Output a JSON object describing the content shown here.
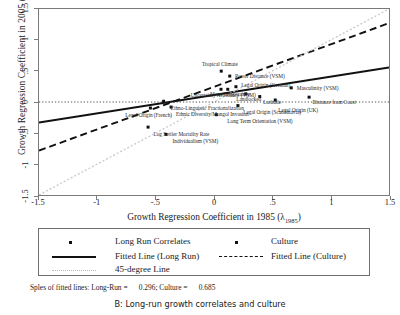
{
  "chart_data": {
    "type": "scatter",
    "title": "B: Long-run growth correlates and culture",
    "xlabel": "Growth Regression Coefficient in 1985 (λ1985)",
    "ylabel": "Growth Regression Coefficient in 2005 (λ2005)",
    "xlim": [
      -1.5,
      1.5
    ],
    "ylim": [
      -1.5,
      1.5
    ],
    "xticks": [
      "-1.5",
      "-1",
      "-.5",
      "0",
      ".5",
      "1",
      "1.5"
    ],
    "xtick_values": [
      -1.5,
      -1,
      -0.5,
      0,
      0.5,
      1,
      1.5
    ],
    "yticks": [
      "-1.5",
      "-1",
      "-.5",
      "0",
      ".5",
      "1",
      "1.5"
    ],
    "ytick_values": [
      -1.5,
      -1,
      -0.5,
      0,
      0.5,
      1,
      1.5
    ],
    "grid": false,
    "legend_position": "below-axes",
    "series": [
      {
        "name": "Long Run Correlates",
        "marker": "square",
        "points": [
          {
            "label": "Tropical Climate",
            "x": 0.062,
            "y": 0.498,
            "label_dx": -0.02,
            "label_dy": 0.105,
            "label_anchor": "middle"
          },
          {
            "label": "Ethno-Linguistic Fractionalization",
            "x": -0.432,
            "y": 0.012,
            "label_dx": 0.055,
            "label_dy": -0.105,
            "label_anchor": "start"
          },
          {
            "label": "Legal Origin (French)",
            "x": -0.545,
            "y": -0.097,
            "label_dx": -0.02,
            "label_dy": -0.105,
            "label_anchor": "middle"
          },
          {
            "label": "Log Settler Mortality Rate",
            "x": -0.565,
            "y": -0.405,
            "label_dx": 0.04,
            "label_dy": -0.105,
            "label_anchor": "start"
          },
          {
            "label": "Legal Origin (German)",
            "x": 0.188,
            "y": 0.247,
            "label_dx": 0.035,
            "label_dy": 0.03,
            "label_anchor": "start"
          },
          {
            "label": "Mean Temperature",
            "x": 0.118,
            "y": 0.205,
            "label_dx": 0.01,
            "label_dy": -0.075,
            "label_anchor": "middle"
          },
          {
            "label": "Landlocked",
            "x": 0.272,
            "y": 0.132,
            "label_dx": 0.015,
            "label_dy": -0.09,
            "label_anchor": "middle"
          },
          {
            "label": "Latitude",
            "x": 0.392,
            "y": 0.088,
            "label_dx": 0.02,
            "label_dy": -0.085,
            "label_anchor": "start"
          },
          {
            "label": "Legal Origin (UK)",
            "x": 0.525,
            "y": 0.032,
            "label_dx": 0.015,
            "label_dy": -0.155,
            "label_anchor": "start"
          },
          {
            "label": "Distance from Coast",
            "x": 0.815,
            "y": 0.078,
            "label_dx": 0.015,
            "label_dy": -0.085,
            "label_anchor": "start"
          },
          {
            "label": "Ethnic Diversity/Mongol Invasion",
            "x": -0.368,
            "y": -0.082,
            "label_dx": 0.035,
            "label_dy": -0.102,
            "label_anchor": "start"
          },
          {
            "label": "Legal Origin (Scandinavia)",
            "x": 0.205,
            "y": -0.058,
            "label_dx": 0.035,
            "label_dy": -0.095,
            "label_anchor": "start"
          }
        ]
      },
      {
        "name": "Culture",
        "marker": "square",
        "points": [
          {
            "label": "Power Distance (VSM)",
            "x": 0.135,
            "y": 0.418,
            "label_dx": 0.035,
            "label_dy": 0.0,
            "label_anchor": "start"
          },
          {
            "label": "Individualism (VSM)",
            "x": -0.412,
            "y": -0.522,
            "label_dx": 0.05,
            "label_dy": -0.105,
            "label_anchor": "start"
          },
          {
            "label": "Long Term Orientation (VSM)",
            "x": 0.02,
            "y": -0.205,
            "label_dx": 0.085,
            "label_dy": -0.095,
            "label_anchor": "start"
          },
          {
            "label": "Uncertainty Avoidance (VSM)",
            "x": 0.06,
            "y": 0.205,
            "label_dx": 0.01,
            "label_dy": -0.092,
            "label_anchor": "middle"
          },
          {
            "label": "Masculinity (VSM)",
            "x": 0.662,
            "y": 0.228,
            "label_dx": 0.035,
            "label_dy": -0.005,
            "label_anchor": "start"
          }
        ]
      }
    ],
    "lines": [
      {
        "name": "Fitted Line (Long Run)",
        "style": "solid",
        "slope": 0.296,
        "x0": -1.5,
        "y0": -0.332,
        "x1": 1.5,
        "y1": 0.557
      },
      {
        "name": "Fitted Line (Culture)",
        "style": "dashed",
        "slope": 0.685,
        "x0": -1.5,
        "y0": -0.783,
        "x1": 1.5,
        "y1": 1.272
      },
      {
        "name": "45-degree Line",
        "style": "dotted",
        "slope": 1.0,
        "x0": -1.5,
        "y0": -1.5,
        "x1": 1.5,
        "y1": 1.5
      },
      {
        "name": "Zero Reference Line",
        "style": "dotted",
        "slope": 0,
        "x0": -1.5,
        "y0": 0,
        "x1": 1.5,
        "y1": 0
      }
    ],
    "slopes_note": {
      "prefix": "Sples of fitted lines: Long-Run =",
      "long_run_value": "0.296",
      "middle": "; Culture =",
      "culture_value": "0.685"
    }
  },
  "legend": {
    "items": [
      {
        "key": "square-marker",
        "label": "Long Run Correlates"
      },
      {
        "key": "square-marker",
        "label": "Culture"
      },
      {
        "key": "solid-line",
        "label": "Fitted Line (Long Run)"
      },
      {
        "key": "dashed-line",
        "label": "Fitted Line (Culture)"
      },
      {
        "key": "dotted-line",
        "label": "45-degree Line"
      }
    ]
  },
  "axis_text": {
    "y_prefix": "Growth Regression Coefficient in 2005 (λ",
    "y_sub": "2005",
    "y_suffix": ")",
    "x_prefix": "Growth Regression Coefficient in 1985 (λ",
    "x_sub": "1985",
    "x_suffix": ")"
  },
  "caption": "B: Long-run growth correlates and culture"
}
